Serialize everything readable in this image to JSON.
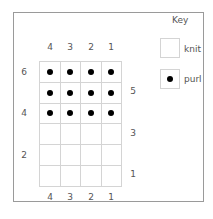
{
  "key": {
    "title": "Key",
    "items": [
      {
        "symbol": "empty",
        "label": "knit"
      },
      {
        "symbol": "dot",
        "label": "purl"
      }
    ]
  },
  "chart": {
    "top_col_labels": [
      "4",
      "3",
      "2",
      "1"
    ],
    "bottom_col_labels": [
      "4",
      "3",
      "2",
      "1"
    ],
    "left_row_labels": {
      "6": "6",
      "4": "4",
      "2": "2"
    },
    "right_row_labels": {
      "5": "5",
      "3": "3",
      "1": "1"
    },
    "rows_top_to_bottom": [
      [
        "purl",
        "purl",
        "purl",
        "purl"
      ],
      [
        "purl",
        "purl",
        "purl",
        "purl"
      ],
      [
        "purl",
        "purl",
        "purl",
        "purl"
      ],
      [
        "knit",
        "knit",
        "knit",
        "knit"
      ],
      [
        "knit",
        "knit",
        "knit",
        "knit"
      ],
      [
        "knit",
        "knit",
        "knit",
        "knit"
      ]
    ]
  }
}
